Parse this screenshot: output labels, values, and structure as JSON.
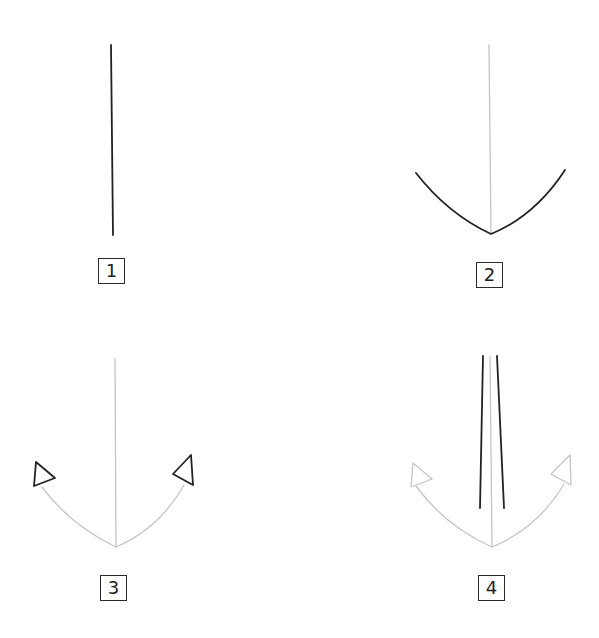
{
  "colors": {
    "ink": "#222222",
    "guide": "#c4c4c4",
    "background": "#ffffff"
  },
  "steps": [
    {
      "number": "1",
      "description": "Draw a vertical line",
      "label_box": {
        "x": 98,
        "y": 258
      },
      "guides": [],
      "ink": [
        {
          "type": "line",
          "d": "M111 45 L113 235"
        }
      ]
    },
    {
      "number": "2",
      "description": "Add a curved arc at the bottom",
      "label_box": {
        "x": 476,
        "y": 262
      },
      "guides": [
        {
          "type": "line",
          "d": "M489 45 L491 234"
        }
      ],
      "ink": [
        {
          "type": "curve",
          "d": "M416 173 Q448 214 491 234 Q535 216 565 170"
        }
      ]
    },
    {
      "number": "3",
      "description": "Add triangular flukes at both ends of the arc",
      "label_box": {
        "x": 100,
        "y": 575
      },
      "guides": [
        {
          "type": "line",
          "d": "M115 359 L116 547"
        },
        {
          "type": "curve",
          "d": "M42 487 Q70 525 116 547 Q160 528 184 485"
        }
      ],
      "ink": [
        {
          "type": "triangle",
          "d": "M36 462 L34 486 L55 478 Z"
        },
        {
          "type": "triangle",
          "d": "M191 455 L173 474 L193 485 Z"
        }
      ]
    },
    {
      "number": "4",
      "description": "Draw two lines for the shank",
      "label_box": {
        "x": 478,
        "y": 575
      },
      "guides": [
        {
          "type": "line",
          "d": "M490 357 L492 547"
        },
        {
          "type": "curve",
          "d": "M416 486 Q445 526 492 547 Q538 528 564 484"
        },
        {
          "type": "triangle",
          "d": "M413 463 L411 487 L432 479 Z"
        },
        {
          "type": "triangle",
          "d": "M570 455 L551 474 L571 485 Z"
        }
      ],
      "ink": [
        {
          "type": "line",
          "d": "M483 356 L480 508"
        },
        {
          "type": "line",
          "d": "M497 356 L504 508"
        }
      ]
    }
  ]
}
